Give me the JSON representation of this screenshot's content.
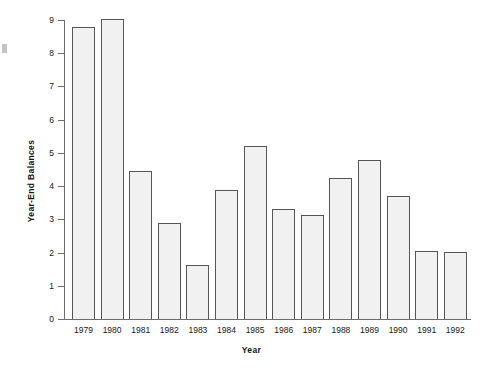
{
  "chart_data": {
    "type": "bar",
    "title": "",
    "xlabel": "Year",
    "ylabel": "Year-End Balances",
    "categories": [
      "1979",
      "1980",
      "1981",
      "1982",
      "1983",
      "1984",
      "1985",
      "1986",
      "1987",
      "1988",
      "1989",
      "1990",
      "1991",
      "1992"
    ],
    "values": [
      8.78,
      9.03,
      4.45,
      2.9,
      1.62,
      3.88,
      5.2,
      3.3,
      3.12,
      4.25,
      4.8,
      3.7,
      2.05,
      2.03
    ],
    "ylim": [
      0,
      9
    ],
    "ytick_labels": [
      "0",
      "1",
      "2",
      "3",
      "4",
      "5",
      "6",
      "7",
      "8",
      "9"
    ],
    "ytick_values": [
      0,
      1,
      2,
      3,
      4,
      5,
      6,
      7,
      8,
      9
    ],
    "grid": false,
    "legend": false,
    "legend_position": "none",
    "bar_fill_color": "#f1f1f1",
    "bar_border_color": "#555555",
    "axis_color": "#6d6d6d"
  },
  "figure": {
    "background_color": "#ffffff",
    "edge_artifact_name": "scan-artifact"
  }
}
